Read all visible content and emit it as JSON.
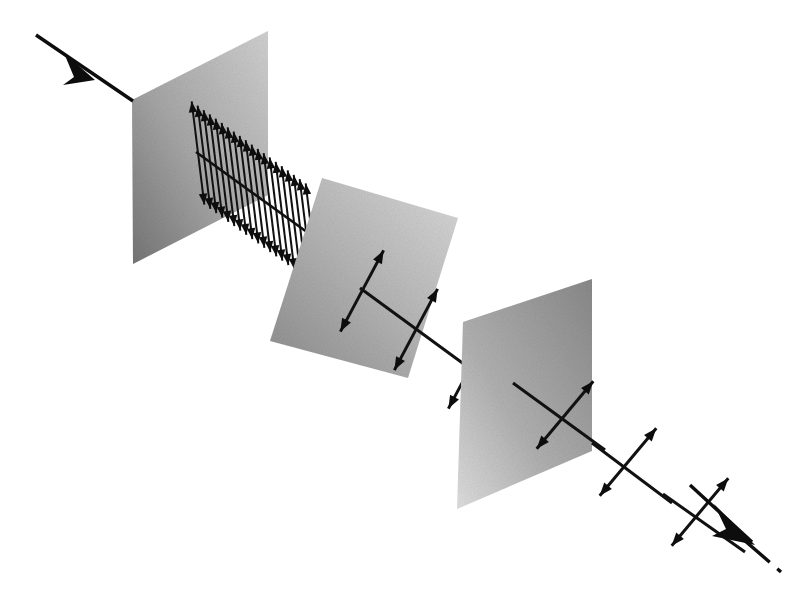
{
  "figure": {
    "background_color": "#ffffff",
    "ink_color": "#0d0d0d"
  },
  "beam": {
    "incoming": {
      "name": "incoming-beam-arrow",
      "label": "incident unpolarized light",
      "start": [
        36,
        35
      ],
      "end": [
        133,
        101
      ],
      "head_at": [
        82,
        68
      ],
      "style": "solid-thick-arrow"
    },
    "outgoing": {
      "name": "outgoing-beam-arrow",
      "label": "transmitted light",
      "start": [
        690,
        485
      ],
      "end": [
        760,
        556
      ],
      "head_at": [
        738,
        530
      ],
      "style": "solid-thick-arrow-with-dashed-tail",
      "dash_segment": [
        [
          740,
          537
        ],
        [
          779,
          570
        ]
      ]
    }
  },
  "panels": [
    {
      "name": "polarizer-panel-1",
      "label": "First polarizing filter",
      "order": 1,
      "transmission_axis": "vertical",
      "corners": [
        [
          132,
          100
        ],
        [
          268,
          31
        ],
        [
          268,
          195
        ],
        [
          133,
          264
        ]
      ],
      "fill_from": "#7c7c7c",
      "fill_to": "#cfcfcf"
    },
    {
      "name": "polarizer-panel-2",
      "label": "Second polarizing filter",
      "order": 2,
      "transmission_axis": "tilted-45-degrees",
      "corners": [
        [
          322,
          178
        ],
        [
          458,
          218
        ],
        [
          408,
          378
        ],
        [
          270,
          341
        ]
      ],
      "fill_from": "#8e8e8e",
      "fill_to": "#d8d8d8"
    },
    {
      "name": "polarizer-panel-3",
      "label": "Third polarizing filter",
      "order": 3,
      "transmission_axis": "tilted",
      "corners": [
        [
          463,
          322
        ],
        [
          592,
          279
        ],
        [
          592,
          451
        ],
        [
          457,
          509
        ]
      ],
      "fill_from": "#8a8a8a",
      "fill_to": "#dedede"
    }
  ],
  "polarization_fields": [
    {
      "name": "polarization-field-1",
      "label": "Vertically polarized wave after first filter",
      "description": "Dense comb of vertical double-headed arrows along the propagation axis",
      "arrow_count": 20,
      "orientation_degrees": 90,
      "axis_start": [
        198,
        153
      ],
      "axis_end": [
        312,
        235
      ],
      "arrow_half_length": 52,
      "arrow_tilt_degrees": 7
    },
    {
      "name": "polarization-field-2",
      "label": "Polarization rotated by second filter",
      "description": "Three double-headed arrows tilted about 60 degrees",
      "arrow_count": 3,
      "orientation_degrees": 62,
      "axis_start": [
        362,
        291
      ],
      "axis_end": [
        470,
        368
      ],
      "arrow_half_length": 46,
      "arrow_tilt_degrees": 0
    },
    {
      "name": "polarization-field-3",
      "label": "Polarization rotated again by third filter",
      "description": "Three double-headed arrows tilted about 45 degrees",
      "arrow_count": 3,
      "orientation_degrees": 50,
      "axis_start": [
        533,
        390
      ],
      "axis_end": [
        690,
        500
      ],
      "arrow_half_length": 44,
      "arrow_tilt_degrees": 0
    }
  ],
  "legend": {
    "visible": false,
    "items": []
  }
}
